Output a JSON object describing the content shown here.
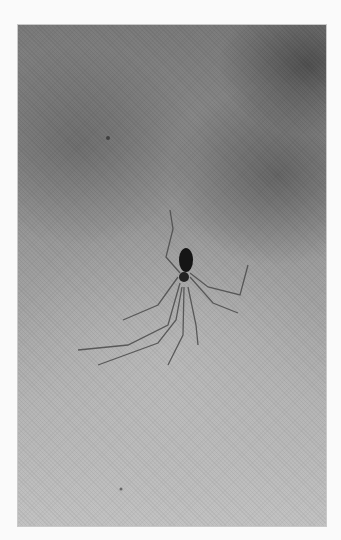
{
  "image": {
    "description": "Grayscale photograph of a long-legged cellar spider on a mottled gray surface",
    "subject": "spider",
    "tones": {
      "page_background": "#fafafa",
      "photo_dark": "#6e6e6e",
      "photo_light": "#c2c2c2",
      "spider_body": "#1a1a1a",
      "spider_legs": "#4a4a4a"
    }
  }
}
